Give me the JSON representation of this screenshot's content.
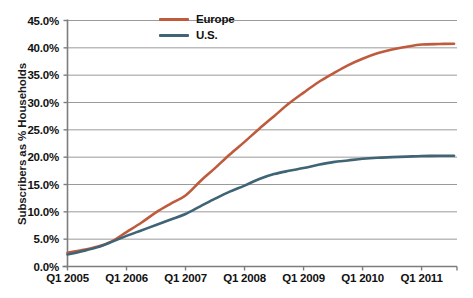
{
  "chart_data": {
    "type": "line",
    "title": "",
    "xlabel": "",
    "ylabel": "Subscribers as % Households",
    "ylim": [
      0,
      45
    ],
    "yticks": [
      "0.0%",
      "5.0%",
      "10.0%",
      "15.0%",
      "20.0%",
      "25.0%",
      "30.0%",
      "35.0%",
      "40.0%",
      "45.0%"
    ],
    "ytick_values": [
      0,
      5,
      10,
      15,
      20,
      25,
      30,
      35,
      40,
      45
    ],
    "categories": [
      "Q1 2005",
      "Q1 2006",
      "Q1 2007",
      "Q1 2008",
      "Q1 2009",
      "Q1 2010",
      "Q1 2011"
    ],
    "x": [
      2005,
      2006,
      2007,
      2008,
      2009,
      2010,
      2011
    ],
    "xlim": [
      2005,
      2011.6
    ],
    "grid": "horizontal",
    "legend_position": "top-center",
    "series": [
      {
        "name": "Europe",
        "color": "#bf5b3c",
        "values": [
          2.5,
          6.3,
          13.0,
          22.8,
          31.8,
          38.0,
          40.6
        ],
        "points": [
          [
            2005.0,
            2.5
          ],
          [
            2005.25,
            3.0
          ],
          [
            2005.5,
            3.6
          ],
          [
            2005.75,
            4.6
          ],
          [
            2006.0,
            6.3
          ],
          [
            2006.25,
            8.0
          ],
          [
            2006.5,
            9.9
          ],
          [
            2006.75,
            11.5
          ],
          [
            2007.0,
            13.0
          ],
          [
            2007.25,
            15.6
          ],
          [
            2007.5,
            18.0
          ],
          [
            2007.75,
            20.5
          ],
          [
            2008.0,
            22.8
          ],
          [
            2008.25,
            25.2
          ],
          [
            2008.5,
            27.5
          ],
          [
            2008.75,
            29.8
          ],
          [
            2009.0,
            31.8
          ],
          [
            2009.25,
            33.7
          ],
          [
            2009.5,
            35.3
          ],
          [
            2009.75,
            36.8
          ],
          [
            2010.0,
            38.0
          ],
          [
            2010.25,
            39.0
          ],
          [
            2010.5,
            39.7
          ],
          [
            2010.75,
            40.2
          ],
          [
            2011.0,
            40.6
          ],
          [
            2011.3,
            40.7
          ],
          [
            2011.55,
            40.75
          ]
        ]
      },
      {
        "name": "U.S.",
        "color": "#3e6476",
        "values": [
          2.2,
          5.6,
          9.6,
          14.8,
          18.0,
          19.7,
          20.2
        ],
        "points": [
          [
            2005.0,
            2.2
          ],
          [
            2005.25,
            2.8
          ],
          [
            2005.5,
            3.5
          ],
          [
            2005.75,
            4.5
          ],
          [
            2006.0,
            5.6
          ],
          [
            2006.25,
            6.6
          ],
          [
            2006.5,
            7.6
          ],
          [
            2006.75,
            8.6
          ],
          [
            2007.0,
            9.6
          ],
          [
            2007.25,
            11.0
          ],
          [
            2007.5,
            12.4
          ],
          [
            2007.75,
            13.7
          ],
          [
            2008.0,
            14.8
          ],
          [
            2008.25,
            16.0
          ],
          [
            2008.5,
            16.9
          ],
          [
            2008.75,
            17.5
          ],
          [
            2009.0,
            18.0
          ],
          [
            2009.25,
            18.6
          ],
          [
            2009.5,
            19.1
          ],
          [
            2009.75,
            19.4
          ],
          [
            2010.0,
            19.7
          ],
          [
            2010.25,
            19.9
          ],
          [
            2010.5,
            20.0
          ],
          [
            2010.75,
            20.1
          ],
          [
            2011.0,
            20.2
          ],
          [
            2011.3,
            20.25
          ],
          [
            2011.55,
            20.25
          ]
        ]
      }
    ]
  },
  "legend": {
    "items": [
      {
        "label": "Europe",
        "color": "#bf5b3c"
      },
      {
        "label": "U.S.",
        "color": "#3e6476"
      }
    ]
  },
  "axes": {
    "y_title": "Subscribers as % Households",
    "axis_color": "#8c8c8c",
    "grid_color": "#9a9a9a"
  }
}
